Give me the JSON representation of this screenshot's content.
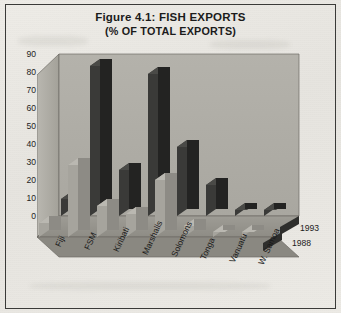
{
  "figure": {
    "title_line1": "Figure 4.1: FISH EXPORTS",
    "title_line2": "(% OF TOTAL EXPORTS)"
  },
  "legend": {
    "entries": [
      {
        "label": "1993",
        "color": "#2a2a2a"
      },
      {
        "label": "1988",
        "color": "#9a9a96"
      }
    ]
  },
  "axis": {
    "y_ticks": [
      "90",
      "80",
      "70",
      "60",
      "50",
      "40",
      "30",
      "20",
      "10",
      "0"
    ]
  },
  "chart_data": {
    "type": "bar",
    "title": "Figure 4.1: FISH EXPORTS (% OF TOTAL EXPORTS)",
    "xlabel": "",
    "ylabel": "% of total exports",
    "ylim": [
      0,
      90
    ],
    "ytick_step": 10,
    "grid": false,
    "legend_position": "right",
    "three_d": true,
    "categories": [
      "Fiji",
      "FSM",
      "Kiribati",
      "Marshalls",
      "Solomons",
      "Tonga",
      "Vanuatu",
      "W. Samoa"
    ],
    "series": [
      {
        "name": "1993",
        "color": "#2a2a2a",
        "values": [
          11,
          97,
          30,
          92,
          45,
          20,
          4,
          4
        ]
      },
      {
        "name": "1988",
        "color": "#9a9a96",
        "values": [
          9,
          47,
          20,
          15,
          37,
          7,
          3,
          3
        ]
      }
    ]
  }
}
